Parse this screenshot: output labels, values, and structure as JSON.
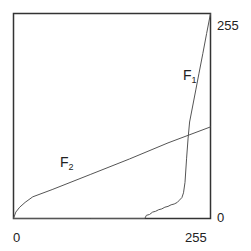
{
  "chart_data": {
    "type": "line",
    "title": "",
    "xlabel": "",
    "ylabel": "",
    "xlim": [
      0,
      255
    ],
    "ylim": [
      0,
      255
    ],
    "grid": false,
    "legend": "inline labels",
    "x_ticks": [
      "0",
      "255"
    ],
    "y_ticks": [
      "0",
      "255"
    ],
    "y_tick_side": "right",
    "series": [
      {
        "name": "F1",
        "label_main": "F",
        "label_sub": "1",
        "x": [
          0,
          100,
          170,
          172,
          176,
          180,
          184,
          188,
          192,
          196,
          200,
          204,
          208,
          212,
          214,
          218,
          220,
          222,
          224,
          226,
          228,
          232,
          236,
          240,
          245,
          250,
          255
        ],
        "y": [
          0,
          0,
          0,
          4,
          5,
          8,
          9,
          11,
          12,
          14,
          15,
          17,
          18,
          20,
          22,
          26,
          32,
          45,
          75,
          100,
          120,
          140,
          160,
          180,
          205,
          230,
          255
        ]
      },
      {
        "name": "F2",
        "label_main": "F",
        "label_sub": "2",
        "x": [
          0,
          3,
          8,
          15,
          25,
          50,
          100,
          150,
          200,
          255
        ],
        "y": [
          0,
          8,
          14,
          20,
          27,
          36,
          55,
          74,
          94,
          114
        ]
      }
    ],
    "color": "#555555"
  }
}
